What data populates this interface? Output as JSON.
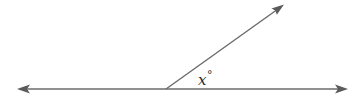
{
  "diagram": {
    "type": "angle",
    "angle_label": {
      "variable": "x",
      "unit_symbol": "°"
    },
    "line": {
      "x1": 17,
      "y1": 89,
      "x2": 348,
      "y2": 89
    },
    "vertex": {
      "x": 166,
      "y": 89
    },
    "ray_end": {
      "x": 284,
      "y": 4
    },
    "stroke_color": "#6b6b6b"
  }
}
